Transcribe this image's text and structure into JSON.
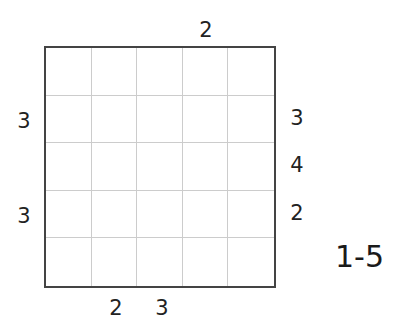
{
  "puzzle": {
    "type": "skyscraper",
    "size": 5,
    "range_label": "1-5",
    "clues": {
      "top": [
        "",
        "",
        "",
        "2",
        ""
      ],
      "bottom": [
        "",
        "2",
        "3",
        "",
        ""
      ],
      "left": [
        "",
        "3",
        "",
        "3",
        ""
      ],
      "right": [
        "",
        "3",
        "4",
        "2",
        ""
      ]
    },
    "cells": [
      [
        "",
        "",
        "",
        "",
        ""
      ],
      [
        "",
        "",
        "",
        "",
        ""
      ],
      [
        "",
        "",
        "",
        "",
        ""
      ],
      [
        "",
        "",
        "",
        "",
        ""
      ],
      [
        "",
        "",
        "",
        "",
        ""
      ]
    ]
  }
}
